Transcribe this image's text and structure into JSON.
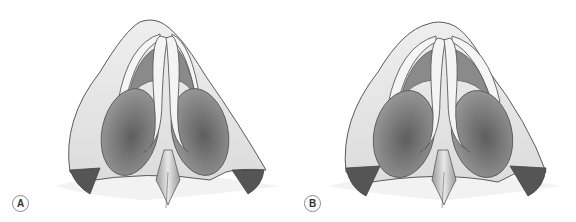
{
  "figure": {
    "panels": [
      {
        "label": "A",
        "description": "Basal view of nose with lateral crura and alar bases (variant A)"
      },
      {
        "label": "B",
        "description": "Basal view of nose with lateral crura and alar bases (variant B)"
      }
    ]
  },
  "colors": {
    "skin": "#e6e6e6",
    "outline": "#5a5a5a",
    "cartilage": "#f0f0f0",
    "nostril_dark": "#6e6e6e",
    "alar_base": "#555555",
    "background": "#ffffff"
  }
}
